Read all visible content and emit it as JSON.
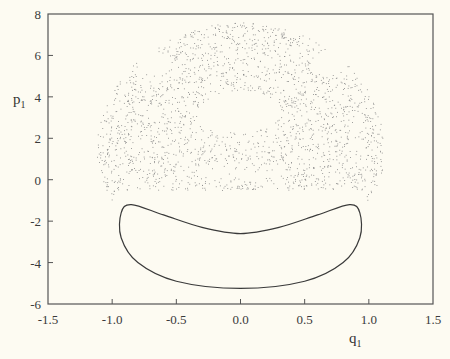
{
  "chart_data": {
    "type": "scatter",
    "title": "",
    "xlabel": "q",
    "xlabel_sub": "1",
    "ylabel": "p",
    "ylabel_sub": "1",
    "xlim": [
      -1.5,
      1.5
    ],
    "ylim": [
      -6,
      8
    ],
    "x_ticks": [
      -1.5,
      -1.0,
      -0.5,
      0.0,
      0.5,
      1.0,
      1.5
    ],
    "x_tick_labels": [
      "-1.5",
      "-1.0",
      "-0.5",
      "0.0",
      "0.5",
      "1.0",
      "1.5"
    ],
    "y_ticks": [
      8,
      6,
      4,
      2,
      0,
      -2,
      -4,
      -6
    ],
    "y_tick_labels": [
      "8",
      "6",
      "4",
      "2",
      "0",
      "-2",
      "-4",
      "-6"
    ],
    "grid": false,
    "legend": null,
    "series": [
      {
        "name": "chaotic-sea",
        "kind": "scatter-dots",
        "description": "Dense cloud of points filling a dome-shaped region spanning q1 ≈ -1.1..1.1, p1 ≈ -3.5..7.6, with empty islands near (0, 3.5), (±0.7, 5.8) and around the lower loop",
        "dome": {
          "q_extent": 1.12,
          "p_top": 7.6,
          "p_center": 1.5,
          "p_bottom_edge": -3.5
        },
        "color": "#777777"
      },
      {
        "name": "regular-orbit",
        "kind": "closed-curve",
        "description": "Closed kidney-shaped invariant curve",
        "points": [
          [
            -0.85,
            -1.2
          ],
          [
            -0.6,
            -1.7
          ],
          [
            -0.3,
            -2.3
          ],
          [
            0.0,
            -2.6
          ],
          [
            0.3,
            -2.3
          ],
          [
            0.6,
            -1.7
          ],
          [
            0.85,
            -1.2
          ],
          [
            0.93,
            -1.6
          ],
          [
            0.93,
            -2.8
          ],
          [
            0.8,
            -4.0
          ],
          [
            0.5,
            -4.9
          ],
          [
            0.0,
            -5.25
          ],
          [
            -0.5,
            -4.9
          ],
          [
            -0.8,
            -4.0
          ],
          [
            -0.93,
            -2.8
          ],
          [
            -0.93,
            -1.6
          ]
        ],
        "color": "#333333"
      }
    ]
  },
  "frame": {
    "left": 48,
    "top": 14,
    "right": 433,
    "bottom": 304
  }
}
